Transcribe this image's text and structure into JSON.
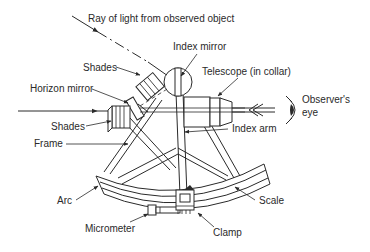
{
  "diagram": {
    "labels": {
      "ray": "Ray of light from observed object",
      "index_mirror": "Index mirror",
      "shades_top": "Shades",
      "telescope": "Telescope (in collar)",
      "horizon_mirror": "Horizon mirror",
      "observer_eye_line1": "Observer's",
      "observer_eye_line2": "eye",
      "shades_bottom": "Shades",
      "index_arm": "Index arm",
      "frame": "Frame",
      "arc": "Arc",
      "scale": "Scale",
      "micrometer": "Micrometer",
      "clamp": "Clamp"
    },
    "colors": {
      "line": "#2a2a2a",
      "background": "#ffffff"
    }
  }
}
